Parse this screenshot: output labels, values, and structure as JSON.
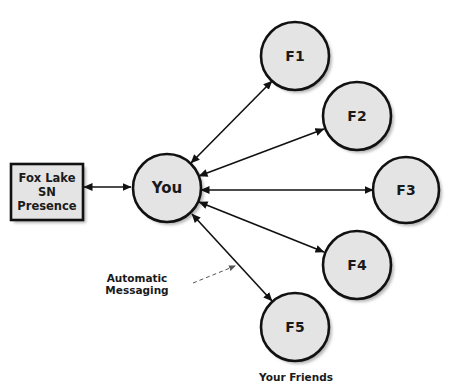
{
  "diagram": {
    "presence_box": {
      "lines": [
        "Fox Lake",
        "SN",
        "Presence"
      ]
    },
    "center_node": {
      "label": "You"
    },
    "friend_nodes": [
      {
        "label": "F1"
      },
      {
        "label": "F2"
      },
      {
        "label": "F3"
      },
      {
        "label": "F4"
      },
      {
        "label": "F5"
      }
    ],
    "annotation": {
      "label": "Automatic Messaging"
    },
    "group_caption": {
      "label": "Your Friends"
    },
    "colors": {
      "node_fill": "#e4e4e4",
      "stroke": "#111111",
      "shadow": "#b5b5b5",
      "dashed_arrow": "#555555"
    }
  }
}
